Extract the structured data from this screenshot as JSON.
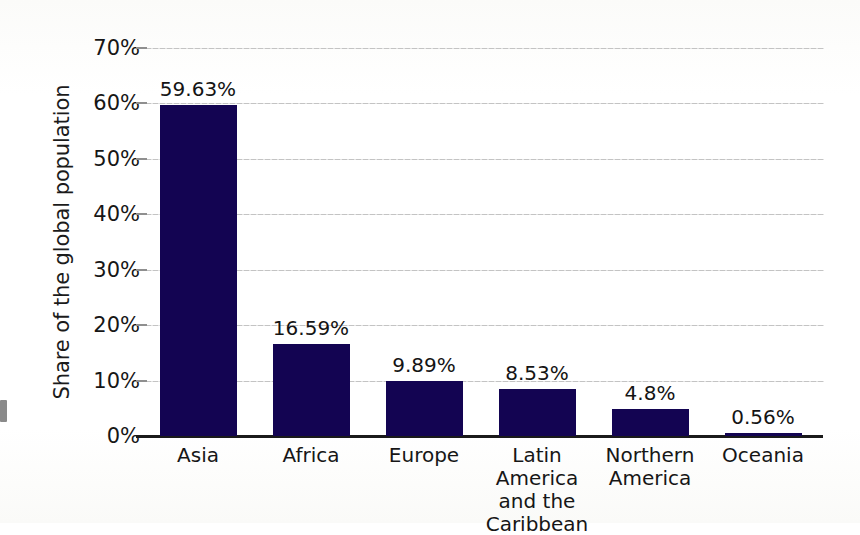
{
  "chart_data": {
    "type": "bar",
    "title": "",
    "subtitle": "",
    "xlabel": "",
    "ylabel": "Share of the global population",
    "ylim": [
      0,
      70
    ],
    "y_tick_step": 10,
    "grid": true,
    "legend": "none",
    "orientation": "vertical",
    "bar_color": "#130452",
    "background_color": "#fdfdfc",
    "gridline_color": "#b9b9b9",
    "axis_color": "#1a1a1a",
    "value_label_suffix": "%",
    "categories": [
      "Asia",
      "Africa",
      "Europe",
      "Latin America and the Caribbean",
      "Northern America",
      "Oceania"
    ],
    "values": [
      59.63,
      16.59,
      9.89,
      8.53,
      4.8,
      0.56
    ],
    "value_labels": [
      "59.63%",
      "16.59%",
      "9.89%",
      "8.53%",
      "4.8%",
      "0.56%"
    ],
    "category_label_lines": [
      [
        "Asia"
      ],
      [
        "Africa"
      ],
      [
        "Europe"
      ],
      [
        "Latin America",
        "and the",
        "Caribbean"
      ],
      [
        "Northern",
        "America"
      ],
      [
        "Oceania"
      ]
    ],
    "y_tick_labels": [
      "0%",
      "10%",
      "20%",
      "30%",
      "40%",
      "50%",
      "60%",
      "70%"
    ],
    "y_tick_values": [
      0,
      10,
      20,
      30,
      40,
      50,
      60,
      70
    ]
  }
}
